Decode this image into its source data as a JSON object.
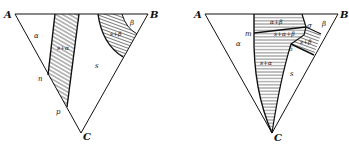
{
  "figure": {
    "left_diagram": {
      "vertices": {
        "a": "A",
        "b": "B",
        "c": "C"
      },
      "points": {
        "n": "n",
        "p": "p"
      },
      "regions": {
        "alpha": "α",
        "s_alpha": "s+α",
        "s": "s",
        "s_beta": "s+β",
        "beta": "β"
      }
    },
    "right_diagram": {
      "vertices": {
        "a": "A",
        "b": "B",
        "c": "C"
      },
      "points": {
        "m": "m",
        "sigma": "σ",
        "delta": "δ"
      },
      "regions": {
        "alpha": "α",
        "alpha_beta": "α+β",
        "s_alpha_beta": "s+α+β",
        "s_alpha": "s+α",
        "s": "s",
        "s_beta": "s+β",
        "beta": "β"
      }
    }
  }
}
